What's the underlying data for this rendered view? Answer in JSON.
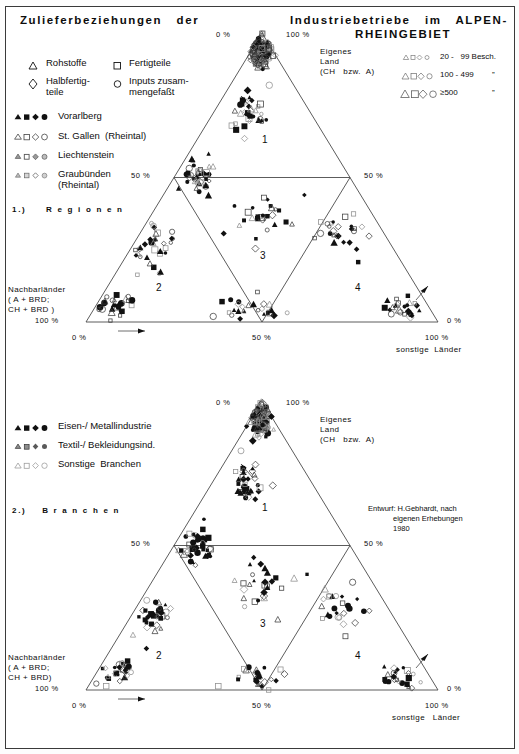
{
  "title": {
    "line1_left": "Zulieferbeziehungen   der",
    "line1_right": "Industriebetriebe   im   ALPEN-",
    "line2_right": "RHEINGEBIET"
  },
  "input_legend": {
    "items": [
      {
        "symbol": "triangle-open",
        "label": "Rohstoffe"
      },
      {
        "symbol": "square-open",
        "label": "Fertigteile"
      },
      {
        "symbol": "diamond-open",
        "label": "Halbfertig-\nteile"
      },
      {
        "symbol": "circle-open",
        "label": "Inputs zusam-\nmengefaßt"
      }
    ]
  },
  "region_legend": {
    "items": [
      {
        "label": "Vorarlberg",
        "style": "filled"
      },
      {
        "label": "St. Gallen  (Rheintal)",
        "style": "open"
      },
      {
        "label": "Liechtenstein",
        "style": "small-open"
      },
      {
        "label": "Graubünden\n(Rheintal)",
        "style": "tiny-open"
      }
    ],
    "section_label": "1.)     R e g i o n e n"
  },
  "branch_legend": {
    "items": [
      {
        "label": "Eisen-/ Metallindustrie",
        "style": "filled"
      },
      {
        "label": "Textil-/ Bekleidungsind.",
        "style": "half"
      },
      {
        "label": "Sonstige  Branchen",
        "style": "open"
      }
    ],
    "section_label": "2.)    B r a n c h e n"
  },
  "size_legend": {
    "rows": [
      {
        "symbols": "size-small",
        "label": "20 -   99 Besch.",
        "unit": ""
      },
      {
        "symbols": "size-medium",
        "label": "100 - 499",
        "unit": "”"
      },
      {
        "symbols": "size-large",
        "label": "≥500",
        "unit": "”"
      }
    ]
  },
  "credit": {
    "line1": "Entwurf: H.Gebhardt, nach",
    "line2": "eigenen Erhebungen",
    "line3": "1980"
  },
  "triangles": [
    {
      "id": "regionen",
      "apex_left_tick": "0 %",
      "apex_right_tick": "100 %",
      "apex_axis_name_line1": "Eigenes",
      "apex_axis_name_line2": "Land",
      "apex_axis_name_line3": "(CH   bzw.  A)",
      "left_mid_tick": "50 %",
      "right_mid_tick": "50 %",
      "left_bottom_tick": "100 %",
      "right_bottom_tick": "0 %",
      "bottom_left_tick": "0 %",
      "bottom_mid_tick": "50 %",
      "bottom_right_tick": "100 %",
      "left_axis_name_line1": "Nachbarländer",
      "left_axis_name_line2": "( A + BRD;",
      "left_axis_name_line3": "CH + BRD )",
      "bottom_axis_name": "sonstige  Länder",
      "sector_numbers": [
        "1",
        "2",
        "3",
        "4"
      ]
    },
    {
      "id": "branchen",
      "apex_left_tick": "0 %",
      "apex_right_tick": "100 %",
      "apex_axis_name_line1": "Eigenes",
      "apex_axis_name_line2": "Land",
      "apex_axis_name_line3": "(CH   bzw.  A)",
      "left_mid_tick": "50 %",
      "right_mid_tick": "50 %",
      "left_bottom_tick": "100 %",
      "right_bottom_tick": "0 %",
      "bottom_left_tick": "0 %",
      "bottom_mid_tick": "50 %",
      "bottom_right_tick": "100 %",
      "left_axis_name_line1": "Nachbarländer",
      "left_axis_name_line2": "( A + BRD;",
      "left_axis_name_line3": "CH + BRD)",
      "bottom_axis_name": "sonstige   Länder",
      "sector_numbers": [
        "1",
        "2",
        "3",
        "4"
      ]
    }
  ],
  "chart_data": {
    "type": "scatter",
    "subtype": "ternary",
    "axes": {
      "apex": "Eigenes Land (CH bzw. A)",
      "left": "Nachbarländer (A + BRD; CH + BRD)",
      "bottom": "sonstige Länder"
    },
    "axis_ticks": [
      "0 %",
      "50 %",
      "100 %"
    ],
    "panels": [
      {
        "name": "1.) Regionen",
        "groups": [
          "Vorarlberg",
          "St. Gallen (Rheintal)",
          "Liechtenstein",
          "Graubünden (Rheintal)"
        ],
        "point_classes": [
          "Rohstoffe",
          "Fertigteile",
          "Halbfertigteile",
          "Inputs zusammengefaßt"
        ],
        "size_classes": [
          "20 - 99 Besch.",
          "100 - 499",
          "≥500"
        ],
        "sectors": [
          1,
          2,
          3,
          4
        ],
        "observation": "Dense cluster of points near the apex (high share of own-country supply) with a secondary cluster at the left vertex (high share of neighbouring countries)."
      },
      {
        "name": "2.) Branchen",
        "groups": [
          "Eisen-/ Metallindustrie",
          "Textil-/ Bekleidungsind.",
          "Sonstige Branchen"
        ],
        "point_classes": [
          "Rohstoffe",
          "Fertigteile",
          "Halbfertigteile",
          "Inputs zusammengefaßt"
        ],
        "size_classes": [
          "20 - 99 Besch.",
          "100 - 499",
          "≥500"
        ],
        "sectors": [
          1,
          2,
          3,
          4
        ],
        "observation": "Same ternary frame; dense apex cluster plus bottom-left and bottom-right vertex clusters."
      }
    ]
  }
}
